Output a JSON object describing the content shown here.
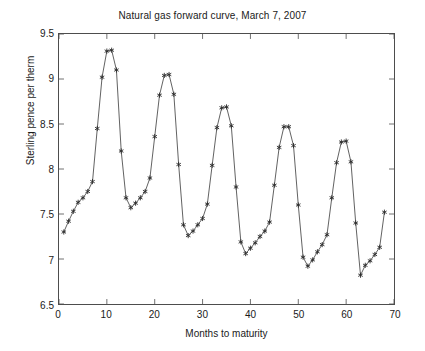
{
  "chart_data": {
    "type": "line",
    "title": "Natural gas forward curve, March 7, 2007",
    "xlabel": "Months to maturity",
    "ylabel": "Sterling pence per therm",
    "xlim": [
      0,
      70
    ],
    "ylim": [
      6.5,
      9.5
    ],
    "xticks": [
      0,
      10,
      20,
      30,
      40,
      50,
      60,
      70
    ],
    "yticks": [
      6.5,
      7,
      7.5,
      8,
      8.5,
      9,
      9.5
    ],
    "xtick_labels": [
      "0",
      "10",
      "20",
      "30",
      "40",
      "50",
      "60",
      "70"
    ],
    "ytick_labels": [
      "6.5",
      "7",
      "7.5",
      "8",
      "8.5",
      "9",
      "9.5"
    ],
    "grid": false,
    "legend": null,
    "marker": "asterisk",
    "line_color": "#3a3a3a",
    "marker_color": "#2b2b2b",
    "x": [
      1,
      2,
      3,
      4,
      5,
      6,
      7,
      8,
      9,
      10,
      11,
      12,
      13,
      14,
      15,
      16,
      17,
      18,
      19,
      20,
      21,
      22,
      23,
      24,
      25,
      26,
      27,
      28,
      29,
      30,
      31,
      32,
      33,
      34,
      35,
      36,
      37,
      38,
      39,
      40,
      41,
      42,
      43,
      44,
      45,
      46,
      47,
      48,
      49,
      50,
      51,
      52,
      53,
      54,
      55,
      56,
      57,
      58,
      59,
      60,
      61,
      62,
      63,
      64,
      65,
      66,
      67,
      68
    ],
    "y": [
      7.3,
      7.42,
      7.53,
      7.63,
      7.68,
      7.75,
      7.86,
      8.45,
      9.02,
      9.31,
      9.32,
      9.1,
      8.2,
      7.68,
      7.57,
      7.62,
      7.68,
      7.75,
      7.9,
      8.36,
      8.82,
      9.04,
      9.05,
      8.83,
      8.05,
      7.38,
      7.26,
      7.31,
      7.38,
      7.45,
      7.61,
      8.04,
      8.46,
      8.68,
      8.69,
      8.48,
      7.8,
      7.19,
      7.06,
      7.12,
      7.18,
      7.25,
      7.31,
      7.41,
      7.82,
      8.24,
      8.47,
      8.47,
      8.26,
      7.6,
      7.02,
      6.92,
      6.99,
      7.08,
      7.16,
      7.27,
      7.68,
      8.07,
      8.3,
      8.31,
      8.08,
      7.4,
      6.82,
      6.93,
      6.98,
      7.05,
      7.13,
      7.52,
      7.91
    ]
  },
  "title": "Natural gas forward curve, March 7, 2007",
  "axes": {
    "x_label": "Months to maturity",
    "y_label": "Sterling pence per therm"
  }
}
